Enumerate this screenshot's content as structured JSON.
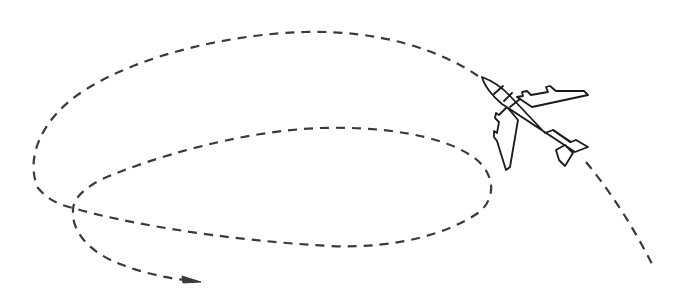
{
  "figure": {
    "title": "Airplane flight trajectory with loops",
    "elements": {
      "airplane": {
        "icon": "airplane-icon",
        "stroke_color": "#1a1a1a",
        "fill_color": "#ffffff"
      },
      "trajectory": {
        "style": "dashed",
        "color": "#3a3a3a",
        "loops": 2
      },
      "arrow": {
        "icon": "arrowhead-icon",
        "direction": "right"
      }
    }
  }
}
